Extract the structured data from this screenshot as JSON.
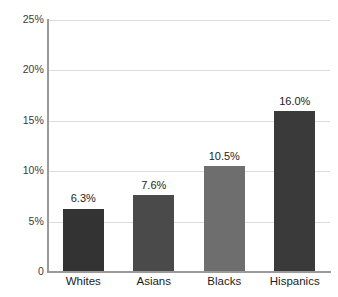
{
  "chart_data": {
    "type": "bar",
    "title": "",
    "subtitle": "",
    "xlabel": "",
    "ylabel": "",
    "categories": [
      "Whites",
      "Asians",
      "Blacks",
      "Hispanics"
    ],
    "values": [
      6.3,
      7.6,
      10.5,
      16.0
    ],
    "data_labels": [
      "6.3%",
      "7.6%",
      "10.5%",
      "16.0%"
    ],
    "bar_colors": [
      "#333333",
      "#4a4a4a",
      "#6e6e6e",
      "#3a3a3a"
    ],
    "ylim": [
      0,
      25
    ],
    "y_ticks": [
      0,
      5,
      10,
      15,
      20,
      25
    ],
    "y_tick_labels": [
      "0",
      "5%",
      "10%",
      "15%",
      "20%",
      "25%"
    ],
    "grid": true,
    "grid_axis": "y",
    "legend": false,
    "legend_position": "none",
    "axis_color": "#9a9a9a",
    "grid_color": "#dcdcdc",
    "background": "#ffffff"
  }
}
